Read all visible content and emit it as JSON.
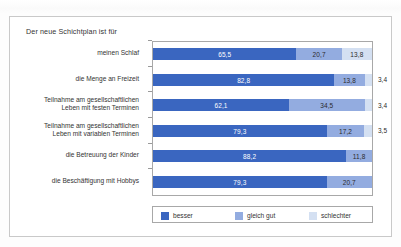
{
  "chart_data": {
    "type": "bar",
    "orientation": "horizontal",
    "stacked": true,
    "stack_mode": "percent",
    "title": "Der neue Schichtplan ist für",
    "xlabel": "",
    "ylabel": "",
    "xlim": [
      0,
      100
    ],
    "grid": false,
    "legend_position": "bottom",
    "categories": [
      "meinen Schlaf",
      "die Menge an Freizeit",
      "Teilnahme am gesellschaftlichen\nLeben mit festen Terminen",
      "Teilnahme am gesellschaftlichen\nLeben mit variablen Terminen",
      "die Betreuung der Kinder",
      "die Beschäftigung mit Hobbys"
    ],
    "series": [
      {
        "name": "besser",
        "color": "#3a66c0",
        "values": [
          65.5,
          82.8,
          62.1,
          79.3,
          88.2,
          79.3
        ],
        "labels": [
          "65,5",
          "82,8",
          "62,1",
          "79,3",
          "88,2",
          "79,3"
        ]
      },
      {
        "name": "gleich gut",
        "color": "#93ace0",
        "values": [
          20.7,
          13.8,
          34.5,
          17.2,
          11.8,
          20.7
        ],
        "labels": [
          "20,7",
          "13,8",
          "34,5",
          "17,2",
          "11,8",
          "20,7"
        ]
      },
      {
        "name": "schlechter",
        "color": "#d4e0f2",
        "values": [
          13.8,
          3.4,
          3.4,
          3.5,
          0,
          0
        ],
        "labels": [
          "13,8",
          "3,4",
          "3,4",
          "3,5",
          "",
          ""
        ]
      }
    ]
  },
  "chart": {
    "title": "Der neue Schichtplan ist für",
    "categories": [
      {
        "line1": "meinen Schlaf",
        "line2": ""
      },
      {
        "line1": "die Menge an Freizeit",
        "line2": ""
      },
      {
        "line1": "Teilnahme am gesellschaftlichen",
        "line2": "Leben mit festen Terminen"
      },
      {
        "line1": "Teilnahme am gesellschaftlichen",
        "line2": "Leben mit variablen Terminen"
      },
      {
        "line1": "die Betreuung der Kinder",
        "line2": ""
      },
      {
        "line1": "die Beschäftigung mit Hobbys",
        "line2": ""
      }
    ],
    "legend": [
      {
        "label": "besser",
        "color": "#3a66c0"
      },
      {
        "label": "gleich gut",
        "color": "#93ace0"
      },
      {
        "label": "schlechter",
        "color": "#d4e0f2"
      }
    ]
  }
}
